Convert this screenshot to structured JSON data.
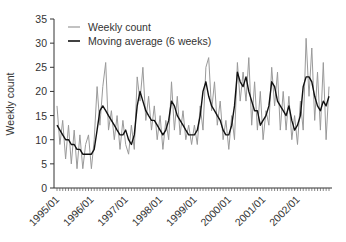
{
  "chart_data": {
    "type": "line",
    "title": "",
    "xlabel": "",
    "ylabel": "Weekly count",
    "ylim": [
      0,
      35
    ],
    "yticks": [
      0,
      5,
      10,
      15,
      20,
      25,
      30,
      35
    ],
    "xlim": [
      "1995/01",
      "2002/12"
    ],
    "xtick_labels": [
      "1995/01",
      "1996/01",
      "1997/01",
      "1998/01",
      "1999/01",
      "2000/01",
      "2001/01",
      "2002/01"
    ],
    "x_minor_ticks": "monthly",
    "grid": false,
    "legend_position": "upper-left",
    "legend": [
      "Weekly count",
      "Moving average (6 weeks)"
    ],
    "x_resolution": "monthly (approximate reading of weekly series)",
    "series": [
      {
        "name": "Weekly count",
        "color": "#9a9a9a",
        "values": [
          17,
          9,
          14,
          6,
          13,
          5,
          12,
          4,
          11,
          4,
          9,
          11,
          4,
          10,
          21,
          13,
          21,
          26,
          12,
          16,
          10,
          15,
          8,
          14,
          9,
          7,
          13,
          8,
          23,
          18,
          25,
          14,
          19,
          12,
          17,
          10,
          15,
          8,
          14,
          10,
          22,
          12,
          19,
          11,
          16,
          10,
          13,
          9,
          13,
          9,
          17,
          12,
          25,
          27,
          16,
          22,
          13,
          18,
          10,
          14,
          8,
          15,
          10,
          26,
          18,
          24,
          18,
          27,
          13,
          22,
          12,
          20,
          10,
          16,
          13,
          25,
          17,
          24,
          12,
          20,
          12,
          19,
          10,
          15,
          9,
          18,
          12,
          31,
          19,
          29,
          14,
          24,
          12,
          26,
          10,
          21
        ]
      },
      {
        "name": "Moving average (6 weeks)",
        "color": "#111111",
        "values": [
          13,
          12,
          11,
          10,
          10,
          9,
          9,
          8,
          8,
          7,
          7,
          7,
          7,
          8,
          12,
          16,
          17,
          16,
          15,
          14,
          13,
          12,
          11,
          11,
          12,
          10,
          9,
          11,
          17,
          20,
          18,
          16,
          15,
          14,
          14,
          13,
          12,
          11,
          12,
          14,
          18,
          17,
          15,
          14,
          13,
          12,
          11,
          11,
          11,
          12,
          15,
          20,
          22,
          19,
          17,
          16,
          15,
          14,
          12,
          11,
          11,
          13,
          17,
          24,
          22,
          21,
          23,
          20,
          18,
          16,
          16,
          13,
          14,
          15,
          17,
          22,
          21,
          18,
          17,
          16,
          15,
          17,
          14,
          12,
          13,
          15,
          21,
          23,
          23,
          22,
          19,
          17,
          16,
          18,
          17,
          19
        ]
      }
    ]
  }
}
